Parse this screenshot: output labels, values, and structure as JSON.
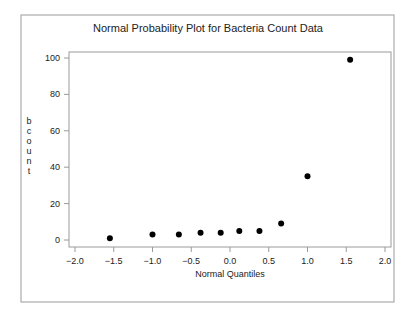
{
  "chart_data": {
    "type": "scatter",
    "title": "Normal Probability Plot for Bacteria Count Data",
    "xlabel": "Normal Quantiles",
    "ylabel": "bcount",
    "xlim": [
      -2.0,
      2.0
    ],
    "ylim": [
      0,
      100
    ],
    "x_ticks": [
      "-2.0",
      "-1.5",
      "-1.0",
      "-0.5",
      "0.0",
      "0.5",
      "1.0",
      "1.5",
      "2.0"
    ],
    "y_ticks": [
      "0",
      "20",
      "40",
      "60",
      "80",
      "100"
    ],
    "grid": false,
    "legend": null,
    "series": [
      {
        "name": "bcount",
        "x": [
          -1.55,
          -1.0,
          -0.66,
          -0.38,
          -0.12,
          0.12,
          0.38,
          0.66,
          1.0,
          1.55
        ],
        "y": [
          1,
          3,
          3,
          4,
          4,
          5,
          5,
          9,
          35,
          99
        ]
      }
    ]
  }
}
